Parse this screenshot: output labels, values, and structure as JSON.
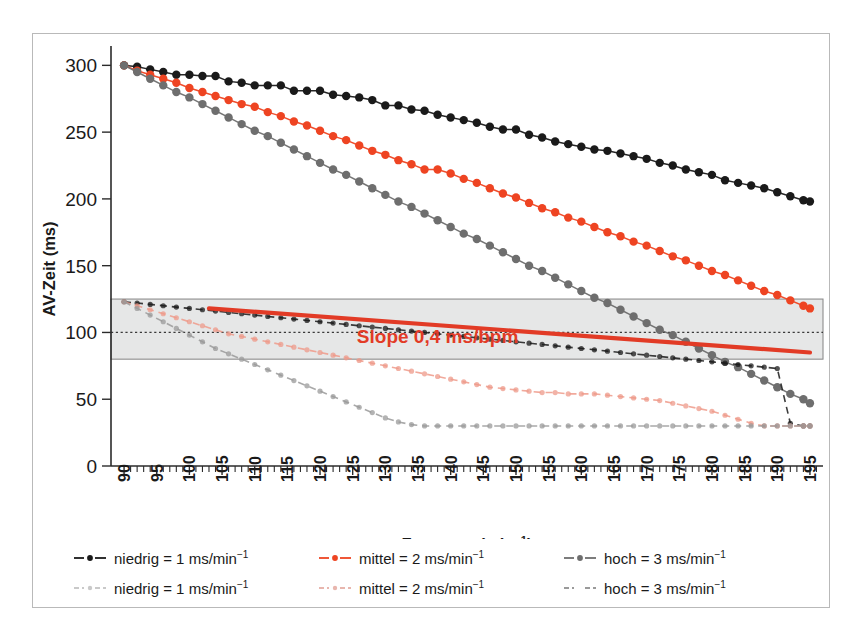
{
  "chart_data": {
    "type": "line",
    "title": "",
    "xlabel": "Frequenz (min⁻¹)",
    "ylabel": "AV-Zeit (ms)",
    "xlim": [
      88,
      197
    ],
    "ylim": [
      0,
      310
    ],
    "yticks": [
      0,
      50,
      100,
      150,
      200,
      250,
      300
    ],
    "xticks": [
      90,
      95,
      100,
      105,
      110,
      115,
      120,
      125,
      130,
      135,
      140,
      145,
      150,
      155,
      160,
      165,
      170,
      175,
      180,
      185,
      190,
      195
    ],
    "grid": false,
    "legend_position": "below",
    "x": [
      90,
      92,
      94,
      96,
      98,
      100,
      102,
      104,
      106,
      108,
      110,
      112,
      114,
      116,
      118,
      120,
      122,
      124,
      126,
      128,
      130,
      132,
      134,
      136,
      138,
      140,
      142,
      144,
      146,
      148,
      150,
      152,
      154,
      156,
      158,
      160,
      162,
      164,
      166,
      168,
      170,
      172,
      174,
      176,
      178,
      180,
      182,
      184,
      186,
      188,
      190,
      192,
      194,
      195
    ],
    "series": [
      {
        "name": "niedrig = 1 ms/min⁻¹",
        "style": "solid",
        "color": "#1a1a1a",
        "values": [
          300,
          299,
          297,
          295,
          293,
          293,
          292,
          292,
          288,
          287,
          285,
          285,
          285,
          281,
          281,
          281,
          278,
          277,
          276,
          274,
          270,
          270,
          267,
          266,
          263,
          261,
          259,
          257,
          254,
          252,
          252,
          248,
          246,
          243,
          241,
          239,
          237,
          236,
          234,
          232,
          230,
          227,
          225,
          222,
          220,
          218,
          214,
          212,
          210,
          208,
          205,
          202,
          199,
          198
        ]
      },
      {
        "name": "mittel = 2 ms/min⁻¹",
        "style": "solid",
        "color": "#ee4422",
        "values": [
          300,
          296,
          293,
          290,
          287,
          283,
          280,
          277,
          274,
          271,
          269,
          265,
          262,
          258,
          255,
          251,
          247,
          244,
          240,
          236,
          233,
          229,
          226,
          222,
          222,
          219,
          215,
          212,
          208,
          204,
          201,
          197,
          193,
          190,
          186,
          183,
          179,
          175,
          172,
          168,
          165,
          161,
          157,
          154,
          150,
          146,
          143,
          139,
          135,
          131,
          128,
          124,
          120,
          118
        ]
      },
      {
        "name": "hoch = 3 ms/min⁻¹",
        "style": "solid",
        "color": "#6e6e6e",
        "values": [
          300,
          295,
          290,
          285,
          280,
          276,
          271,
          266,
          261,
          256,
          251,
          247,
          242,
          237,
          232,
          227,
          222,
          218,
          213,
          208,
          203,
          198,
          194,
          189,
          184,
          179,
          174,
          170,
          165,
          160,
          155,
          150,
          146,
          141,
          136,
          131,
          126,
          122,
          117,
          112,
          107,
          102,
          98,
          93,
          88,
          83,
          78,
          74,
          69,
          64,
          59,
          54,
          50,
          47
        ]
      },
      {
        "name": "niedrig = 1 ms/min⁻¹",
        "style": "dashed",
        "color": "#1a1a1a",
        "values": [
          123,
          122,
          121,
          120,
          119,
          118,
          117,
          116,
          115,
          114,
          113,
          112,
          111,
          110,
          109,
          108,
          107,
          106,
          105,
          104,
          103,
          102,
          101,
          100,
          99,
          98,
          97,
          96,
          95,
          94,
          93,
          92,
          91,
          90,
          89,
          88,
          87,
          86,
          85,
          84,
          83,
          82,
          81,
          80,
          79,
          78,
          77,
          76,
          75,
          74,
          73,
          32,
          30,
          30
        ]
      },
      {
        "name": "mittel = 2 ms/min⁻¹",
        "style": "dashed",
        "color": "#ee9a8a",
        "values": [
          123,
          120,
          117,
          114,
          111,
          108,
          105,
          102,
          99,
          97,
          95,
          93,
          91,
          89,
          87,
          85,
          83,
          81,
          79,
          77,
          75,
          73,
          71,
          69,
          67,
          65,
          63,
          61,
          59,
          58,
          57,
          56,
          55,
          55,
          54,
          54,
          54,
          53,
          52,
          51,
          50,
          49,
          47,
          45,
          43,
          41,
          38,
          35,
          32,
          30,
          30,
          30,
          30,
          30
        ]
      },
      {
        "name": "hoch = 3 ms/min⁻¹",
        "style": "dashed",
        "color": "#9a9a9a",
        "values": [
          123,
          118,
          113,
          108,
          103,
          98,
          93,
          88,
          84,
          80,
          76,
          72,
          68,
          64,
          60,
          56,
          52,
          48,
          44,
          40,
          36,
          33,
          31,
          30,
          30,
          30,
          30,
          30,
          30,
          30,
          30,
          30,
          30,
          30,
          30,
          30,
          30,
          30,
          30,
          30,
          30,
          30,
          30,
          30,
          30,
          30,
          30,
          30,
          30,
          30,
          30,
          30,
          30,
          30
        ]
      }
    ],
    "band": {
      "label": "normal range",
      "ymin": 80,
      "ymax": 125,
      "midline": 100,
      "color": "#e6e7e7"
    },
    "trendline": {
      "x0": 103,
      "y0": 118,
      "x1": 195,
      "y1": 85,
      "color": "#e23b26",
      "label": "Slope 0,4 ms/bpm"
    },
    "annotations": [
      {
        "text": "Slope 0,4 ms/bpm",
        "x": 138,
        "y": 92,
        "color": "#e23b26"
      }
    ]
  },
  "axes": {
    "y_title": "AV-Zeit (ms)",
    "x_title_main": "Frequenz (min",
    "x_title_sup": "−1",
    "x_title_end": ")",
    "y_ticks": [
      "300",
      "250",
      "200",
      "150",
      "100",
      "50",
      "0"
    ],
    "x_ticks": [
      "90",
      "95",
      "100",
      "105",
      "110",
      "115",
      "120",
      "125",
      "130",
      "135",
      "140",
      "145",
      "150",
      "155",
      "160",
      "165",
      "170",
      "175",
      "180",
      "185",
      "190",
      "195"
    ]
  },
  "annotation": {
    "slope_label": "Slope 0,4 ms/bpm"
  },
  "legend": {
    "rows": [
      [
        {
          "label": "niedrig = 1 ms/min",
          "sup": "−1",
          "color": "#1a1a1a",
          "style": "solid",
          "marker": true
        },
        {
          "label": "mittel = 2 ms/min",
          "sup": "−1",
          "color": "#ee4422",
          "style": "solid",
          "marker": true
        },
        {
          "label": "hoch = 3 ms/min",
          "sup": "−1",
          "color": "#6e6e6e",
          "style": "solid",
          "marker": true
        }
      ],
      [
        {
          "label": "niedrig = 1 ms/min",
          "sup": "−1",
          "color": "#c9c9c9",
          "style": "dashed",
          "marker": true
        },
        {
          "label": "mittel = 2 ms/min",
          "sup": "−1",
          "color": "#e8b6ae",
          "style": "dashed",
          "marker": true
        },
        {
          "label": "hoch = 3 ms/min",
          "sup": "−1",
          "color": "#9a9a9a",
          "style": "dashed",
          "marker": false
        }
      ]
    ]
  },
  "colors": {
    "black_series": "#1a1a1a",
    "red_series": "#ee4422",
    "gray_series": "#6e6e6e",
    "trend_red": "#e23b26",
    "band_gray": "#e6e7e7",
    "border": "#b9b9b9"
  }
}
